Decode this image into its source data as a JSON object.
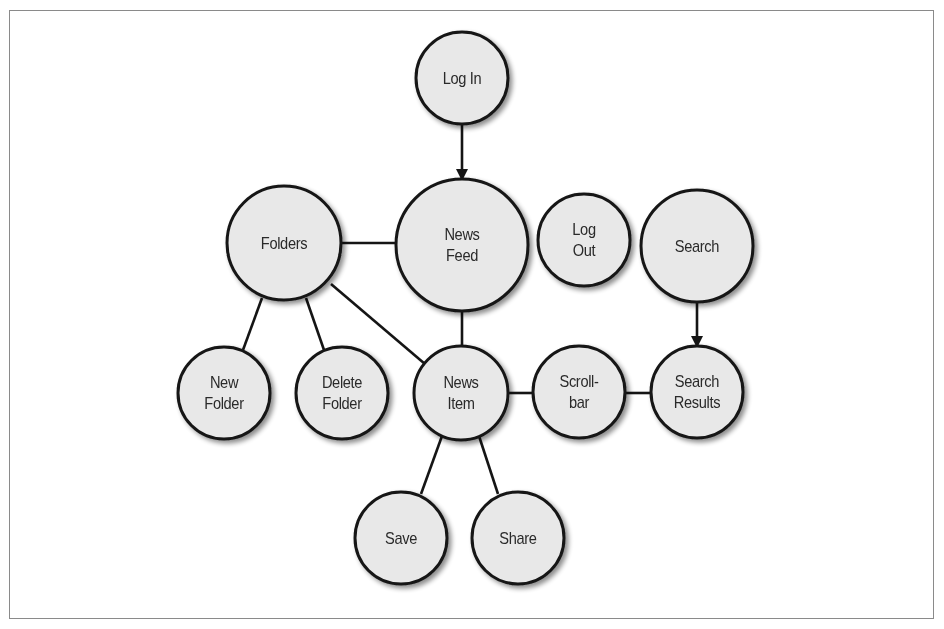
{
  "diagram": {
    "type": "site-map",
    "colors": {
      "node_fill": "#e8e8e8",
      "node_stroke": "#151515",
      "edge": "#151515",
      "frame": "#8a8a8a",
      "text": "#2a2a2a"
    },
    "nodes": [
      {
        "id": "login",
        "lines": [
          "Log In"
        ],
        "cx": 462,
        "cy": 78,
        "r": 46
      },
      {
        "id": "newsfeed",
        "lines": [
          "News",
          "Feed"
        ],
        "cx": 462,
        "cy": 245,
        "r": 66
      },
      {
        "id": "folders",
        "lines": [
          "Folders"
        ],
        "cx": 284,
        "cy": 243,
        "r": 57
      },
      {
        "id": "logout",
        "lines": [
          "Log",
          "Out"
        ],
        "cx": 584,
        "cy": 240,
        "r": 46
      },
      {
        "id": "search",
        "lines": [
          "Search"
        ],
        "cx": 697,
        "cy": 246,
        "r": 56
      },
      {
        "id": "newfolder",
        "lines": [
          "New",
          "Folder"
        ],
        "cx": 224,
        "cy": 393,
        "r": 46
      },
      {
        "id": "deletefolder",
        "lines": [
          "Delete",
          "Folder"
        ],
        "cx": 342,
        "cy": 393,
        "r": 46
      },
      {
        "id": "newsitem",
        "lines": [
          "News",
          "Item"
        ],
        "cx": 461,
        "cy": 393,
        "r": 47
      },
      {
        "id": "scrollbar",
        "lines": [
          "Scroll-",
          "bar"
        ],
        "cx": 579,
        "cy": 392,
        "r": 46
      },
      {
        "id": "searchresults",
        "lines": [
          "Search",
          "Results"
        ],
        "cx": 697,
        "cy": 392,
        "r": 46
      },
      {
        "id": "save",
        "lines": [
          "Save"
        ],
        "cx": 401,
        "cy": 538,
        "r": 46
      },
      {
        "id": "share",
        "lines": [
          "Share"
        ],
        "cx": 518,
        "cy": 538,
        "r": 46
      }
    ],
    "edges": [
      {
        "from": "login",
        "to": "newsfeed",
        "arrow": true,
        "x1": 462,
        "y1": 124,
        "x2": 462,
        "y2": 179
      },
      {
        "from": "folders",
        "to": "newsfeed",
        "arrow": false,
        "x1": 341,
        "y1": 243,
        "x2": 397,
        "y2": 243
      },
      {
        "from": "folders",
        "to": "newfolder",
        "arrow": false,
        "x1": 262,
        "y1": 298,
        "x2": 243,
        "y2": 350
      },
      {
        "from": "folders",
        "to": "deletefolder",
        "arrow": false,
        "x1": 306,
        "y1": 298,
        "x2": 324,
        "y2": 350
      },
      {
        "from": "folders",
        "to": "newsitem",
        "arrow": false,
        "x1": 331,
        "y1": 284,
        "x2": 425,
        "y2": 364
      },
      {
        "from": "newsfeed",
        "to": "newsitem",
        "arrow": false,
        "x1": 462,
        "y1": 311,
        "x2": 462,
        "y2": 346
      },
      {
        "from": "newsitem",
        "to": "scrollbar",
        "arrow": false,
        "x1": 508,
        "y1": 393,
        "x2": 533,
        "y2": 393
      },
      {
        "from": "scrollbar",
        "to": "searchresults",
        "arrow": false,
        "x1": 625,
        "y1": 393,
        "x2": 651,
        "y2": 393
      },
      {
        "from": "search",
        "to": "searchresults",
        "arrow": true,
        "x1": 697,
        "y1": 302,
        "x2": 697,
        "y2": 346
      },
      {
        "from": "newsitem",
        "to": "save",
        "arrow": false,
        "x1": 442,
        "y1": 436,
        "x2": 421,
        "y2": 494
      },
      {
        "from": "newsitem",
        "to": "share",
        "arrow": false,
        "x1": 479,
        "y1": 436,
        "x2": 498,
        "y2": 494
      }
    ]
  }
}
